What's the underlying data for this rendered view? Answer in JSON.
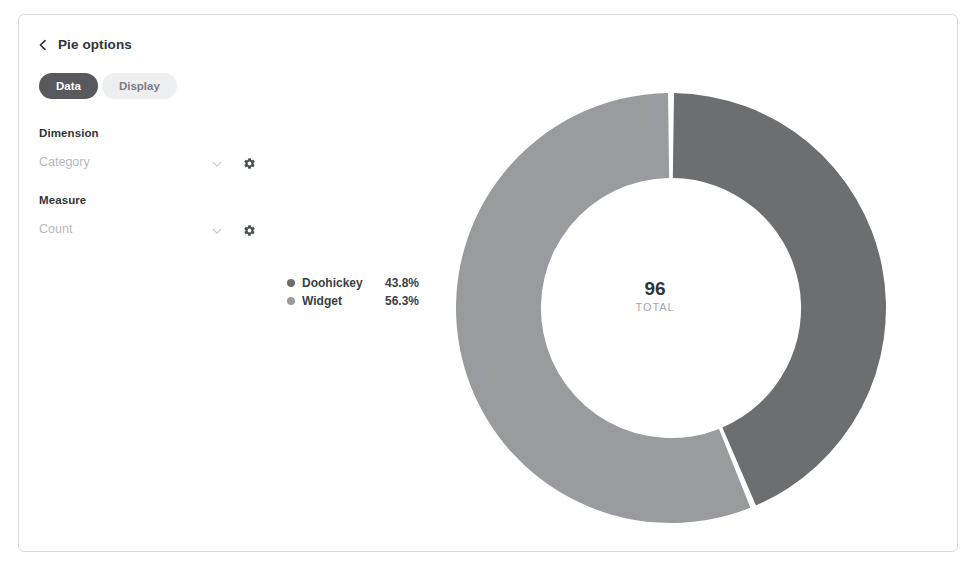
{
  "header": {
    "back_icon": "chevron-left-icon",
    "title": "Pie options"
  },
  "tabs": [
    {
      "label": "Data",
      "active": true
    },
    {
      "label": "Display",
      "active": false
    }
  ],
  "form": {
    "dimension": {
      "label": "Dimension",
      "value": "Category",
      "chevron_icon": "chevron-down-icon",
      "settings_icon": "gear-icon"
    },
    "measure": {
      "label": "Measure",
      "value": "Count",
      "chevron_icon": "chevron-down-icon",
      "settings_icon": "gear-icon"
    }
  },
  "legend": [
    {
      "name": "Doohickey",
      "percent": "43.8%",
      "color": "#6d6e70"
    },
    {
      "name": "Widget",
      "percent": "56.3%",
      "color": "#9a9b9e"
    }
  ],
  "center": {
    "value": "96",
    "label": "TOTAL"
  },
  "colors": {
    "card_border": "#d8dadd",
    "tab_active_bg": "#58595d",
    "tab_active_text": "#ffffff",
    "tab_inactive_bg": "#eeeff0",
    "tab_inactive_text": "#7b7e84",
    "text_primary": "#2e353b",
    "text_muted": "#b6b9bd",
    "slice_doohickey": "#6d6e70",
    "slice_widget": "#9a9b9e"
  },
  "chart_data": {
    "type": "pie",
    "title": "",
    "donut": true,
    "total": 96,
    "total_label": "TOTAL",
    "legend_position": "left",
    "labels": [
      "Doohickey",
      "Widget"
    ],
    "percents": [
      43.8,
      56.3
    ],
    "values": [
      42,
      54
    ],
    "colors": [
      "#6d6e70",
      "#9a9b9e"
    ],
    "start_angle_deg": 0,
    "inner_radius_ratio": 0.605
  }
}
